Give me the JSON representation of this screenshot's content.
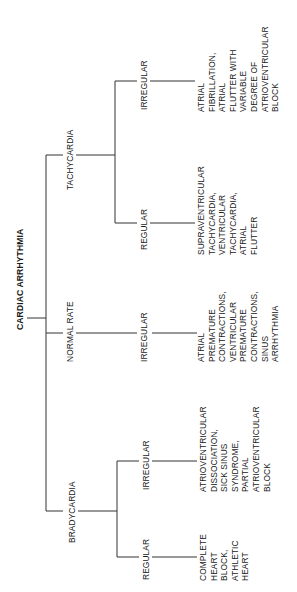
{
  "title": "CARDIAC ARRHYTHMIA",
  "branches": {
    "tachycardia": {
      "label": "TACHYCARDIA",
      "regular": {
        "label": "REGULAR",
        "examples": "SUPRAVENTRICULAR\nTACHYCARDIA,\nVENTRICULAR\nTACHYCARDIA,\nATRIAL\nFLUTTER"
      },
      "irregular": {
        "label": "IRREGULAR",
        "examples": "ATRIAL\nFIBRILLATION,\nATRIAL\nFLUTTER WITH\nVARIABLE\nDEGREE OF\nATRIOVENTRICULAR\nBLOCK"
      }
    },
    "normal_rate": {
      "label": "NORMAL RATE",
      "irregular": {
        "label": "IRREGULAR",
        "examples": "ATRIAL\nPREMATURE\nCONTRACTIONS,\nVENTRICULAR\nPREMATURE\nCONTRACTIONS,\nSINUS\nARRHYTHMIA"
      }
    },
    "bradycardia": {
      "label": "BRADYCARDIA",
      "irregular": {
        "label": "IRREGULAR",
        "examples": "ATRIOVENTRICULAR\nDISSOCIATION,\nSICK SINUS\nSYNDROME,\nPARTIAL\nATRIOVENTRICULAR\nBLOCK"
      },
      "regular": {
        "label": "REGULAR",
        "examples": "COMPLETE\nHEART\nBLOCK,\nATHLETIC\nHEART"
      }
    }
  }
}
